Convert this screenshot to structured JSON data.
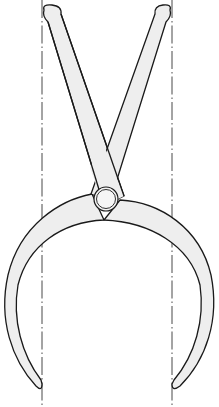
{
  "figure": {
    "caption": "",
    "colors": {
      "background": "#ffffff",
      "outline": "#1a1a1a",
      "fill": "#eeeeee",
      "centerline": "#333333"
    },
    "parts": [
      {
        "name": "left-handle"
      },
      {
        "name": "right-handle"
      },
      {
        "name": "pivot-rivet"
      },
      {
        "name": "left-jaw"
      },
      {
        "name": "right-jaw"
      },
      {
        "name": "left-centerline"
      },
      {
        "name": "right-centerline"
      }
    ]
  }
}
